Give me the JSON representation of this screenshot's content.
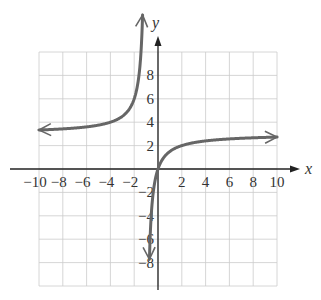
{
  "chart_data": {
    "type": "line",
    "title": "",
    "xlabel": "x",
    "ylabel": "y",
    "xlim": [
      -10,
      10
    ],
    "ylim": [
      -10,
      10
    ],
    "grid": true,
    "grid_step": 2,
    "x_ticks": [
      -10,
      -8,
      -6,
      -4,
      -2,
      2,
      4,
      6,
      8,
      10
    ],
    "x_tick_labels": [
      "−10",
      "−8",
      "−6",
      "−4",
      "−2",
      "2",
      "4",
      "6",
      "8",
      "10"
    ],
    "y_ticks": [
      8,
      6,
      4,
      2,
      -2,
      -4,
      -6,
      -8
    ],
    "y_tick_labels": [
      "8",
      "6",
      "4",
      "2",
      "−2",
      "−4",
      "−6",
      "−8"
    ],
    "function": "y = 3 - 3/(x+1)",
    "asymptotes": {
      "vertical": -1,
      "horizontal": 3
    },
    "series": [
      {
        "name": "left-branch",
        "x": [
          -10,
          -8,
          -6,
          -4,
          -3,
          -2,
          -1.6,
          -1.3
        ],
        "y": [
          3.33,
          3.43,
          3.6,
          4.0,
          4.5,
          6.0,
          8.0,
          10.0
        ],
        "arrows": [
          "left",
          "up"
        ]
      },
      {
        "name": "right-branch",
        "x": [
          -0.7,
          -0.5,
          0,
          1,
          2,
          4,
          6,
          8,
          10
        ],
        "y": [
          -7.0,
          -3.0,
          0.0,
          1.5,
          2.0,
          2.4,
          2.57,
          2.67,
          2.73
        ],
        "arrows": [
          "down",
          "right"
        ]
      }
    ],
    "colors": {
      "curve": "#666666",
      "axis": "#222222",
      "grid": "#cccccc"
    }
  }
}
